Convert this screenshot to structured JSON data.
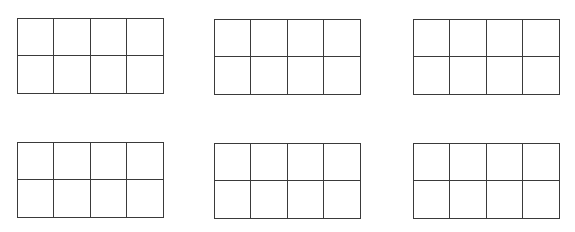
{
  "figure": {
    "line_color": "#3a3a3a",
    "background_color": "#ffffff",
    "grids": [
      {
        "id": "grid-1",
        "rows": 2,
        "cols": 4,
        "filled_cells": 0
      },
      {
        "id": "grid-2",
        "rows": 2,
        "cols": 4,
        "filled_cells": 0
      },
      {
        "id": "grid-3",
        "rows": 2,
        "cols": 4,
        "filled_cells": 0
      },
      {
        "id": "grid-4",
        "rows": 2,
        "cols": 4,
        "filled_cells": 0
      },
      {
        "id": "grid-5",
        "rows": 2,
        "cols": 4,
        "filled_cells": 0
      },
      {
        "id": "grid-6",
        "rows": 2,
        "cols": 4,
        "filled_cells": 0
      }
    ]
  }
}
